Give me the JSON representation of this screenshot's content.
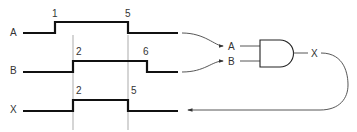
{
  "diagram": {
    "signals": [
      {
        "name": "A",
        "rise_label": "1",
        "fall_label": "5"
      },
      {
        "name": "B",
        "rise_label": "2",
        "fall_label": "6"
      },
      {
        "name": "X",
        "rise_label": "2",
        "fall_label": "5"
      }
    ],
    "gate": {
      "type": "AND",
      "inputs": [
        "A",
        "B"
      ],
      "output": "X"
    },
    "colors": {
      "signal": "#111111",
      "guide": "#888888",
      "text": "#333333"
    }
  }
}
